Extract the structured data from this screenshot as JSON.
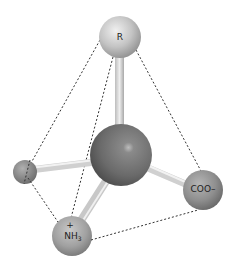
{
  "diagram": {
    "title": "",
    "type": "tetrahedral amino acid ball-and-stick model",
    "atoms": {
      "r_group": {
        "label": "R",
        "cx": 120,
        "cy": 37,
        "r": 21,
        "color": "#b8b8b8"
      },
      "alpha_carbon": {
        "label": "",
        "cx": 121,
        "cy": 155,
        "r": 31,
        "color": "#6e6e6e"
      },
      "hydrogen": {
        "label": "",
        "cx": 25,
        "cy": 172,
        "r": 12,
        "color": "#8a8a8a"
      },
      "carboxyl": {
        "label": "COO–",
        "cx": 203,
        "cy": 190,
        "r": 20,
        "color": "#8c8c8c"
      },
      "amino": {
        "label_main": "NH",
        "label_sub": "3",
        "label_charge": "+",
        "cx": 72,
        "cy": 236,
        "r": 20,
        "color": "#a0a0a0"
      }
    },
    "bonds": [
      {
        "from": "alpha_carbon",
        "to": "r_group"
      },
      {
        "from": "alpha_carbon",
        "to": "hydrogen"
      },
      {
        "from": "alpha_carbon",
        "to": "carboxyl"
      },
      {
        "from": "alpha_carbon",
        "to": "amino"
      }
    ],
    "tetrahedron_edges": [
      {
        "from": "r_group",
        "to": "hydrogen"
      },
      {
        "from": "r_group",
        "to": "amino"
      },
      {
        "from": "r_group",
        "to": "carboxyl"
      },
      {
        "from": "hydrogen",
        "to": "amino"
      },
      {
        "from": "amino",
        "to": "carboxyl"
      }
    ]
  }
}
